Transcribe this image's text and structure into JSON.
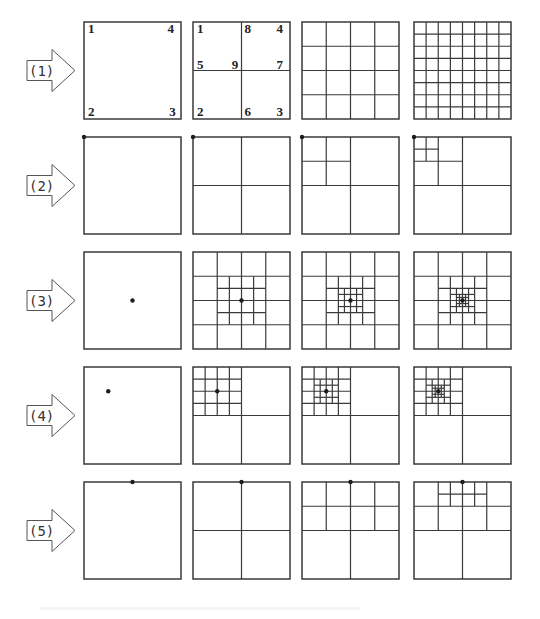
{
  "figure": {
    "stroke_color": "#3a3a3a",
    "dot_color": "#1e1e1e",
    "columns_x": [
      84,
      193,
      302,
      414
    ],
    "box_size": 97,
    "rows": [
      {
        "label": "(1)",
        "y": 22,
        "panels": [
          {
            "lines": [],
            "dot": null,
            "labels": [
              {
                "t": "1",
                "x": 0.04,
                "y": 0.11
              },
              {
                "t": "4",
                "x": 0.86,
                "y": 0.11
              },
              {
                "t": "2",
                "x": 0.04,
                "y": 0.97
              },
              {
                "t": "3",
                "x": 0.88,
                "y": 0.97
              }
            ]
          },
          {
            "lines": [
              [
                0.5,
                0,
                0.5,
                1
              ],
              [
                0,
                0.5,
                1,
                0.5
              ]
            ],
            "dot": null,
            "labels": [
              {
                "t": "1",
                "x": 0.04,
                "y": 0.11
              },
              {
                "t": "8",
                "x": 0.53,
                "y": 0.11
              },
              {
                "t": "4",
                "x": 0.86,
                "y": 0.11
              },
              {
                "t": "5",
                "x": 0.04,
                "y": 0.48
              },
              {
                "t": "9",
                "x": 0.4,
                "y": 0.48
              },
              {
                "t": "7",
                "x": 0.86,
                "y": 0.48
              },
              {
                "t": "2",
                "x": 0.04,
                "y": 0.97
              },
              {
                "t": "6",
                "x": 0.53,
                "y": 0.97
              },
              {
                "t": "3",
                "x": 0.86,
                "y": 0.97
              }
            ]
          },
          {
            "grid": 4,
            "lines": [],
            "dot": null,
            "labels": []
          },
          {
            "grid": 8,
            "lines": [],
            "dot": null,
            "labels": []
          }
        ]
      },
      {
        "label": "(2)",
        "y": 137,
        "panels": [
          {
            "lines": [],
            "dot": [
              0,
              0
            ],
            "labels": []
          },
          {
            "lines": [
              [
                0.5,
                0,
                0.5,
                1
              ],
              [
                0,
                0.5,
                1,
                0.5
              ]
            ],
            "dot": [
              0,
              0
            ],
            "labels": []
          },
          {
            "lines": [
              [
                0.5,
                0,
                0.5,
                1
              ],
              [
                0,
                0.5,
                1,
                0.5
              ],
              [
                0.25,
                0,
                0.25,
                0.5
              ],
              [
                0,
                0.25,
                0.5,
                0.25
              ]
            ],
            "dot": [
              0,
              0
            ],
            "labels": []
          },
          {
            "lines": [
              [
                0.5,
                0,
                0.5,
                1
              ],
              [
                0,
                0.5,
                1,
                0.5
              ],
              [
                0.25,
                0,
                0.25,
                0.5
              ],
              [
                0,
                0.25,
                0.5,
                0.25
              ],
              [
                0.125,
                0,
                0.125,
                0.25
              ],
              [
                0,
                0.125,
                0.25,
                0.125
              ]
            ],
            "dot": [
              0,
              0
            ],
            "labels": []
          }
        ]
      },
      {
        "label": "(3)",
        "y": 252,
        "panels": [
          {
            "lines": [],
            "dot": [
              0.5,
              0.5
            ],
            "labels": []
          },
          {
            "grid": 4,
            "lines": [
              [
                0.375,
                0.25,
                0.375,
                0.75
              ],
              [
                0.625,
                0.25,
                0.625,
                0.75
              ],
              [
                0.25,
                0.375,
                0.75,
                0.375
              ],
              [
                0.25,
                0.625,
                0.75,
                0.625
              ]
            ],
            "dot": [
              0.5,
              0.5
            ],
            "labels": []
          },
          {
            "grid": 4,
            "lines": [
              [
                0.375,
                0.25,
                0.375,
                0.75
              ],
              [
                0.625,
                0.25,
                0.625,
                0.75
              ],
              [
                0.25,
                0.375,
                0.75,
                0.375
              ],
              [
                0.25,
                0.625,
                0.75,
                0.625
              ],
              [
                0.4375,
                0.375,
                0.4375,
                0.625
              ],
              [
                0.5625,
                0.375,
                0.5625,
                0.625
              ],
              [
                0.375,
                0.4375,
                0.625,
                0.4375
              ],
              [
                0.375,
                0.5625,
                0.625,
                0.5625
              ]
            ],
            "dot": [
              0.5,
              0.5
            ],
            "labels": []
          },
          {
            "grid": 4,
            "lines": [
              [
                0.375,
                0.25,
                0.375,
                0.75
              ],
              [
                0.625,
                0.25,
                0.625,
                0.75
              ],
              [
                0.25,
                0.375,
                0.75,
                0.375
              ],
              [
                0.25,
                0.625,
                0.75,
                0.625
              ],
              [
                0.4375,
                0.375,
                0.4375,
                0.625
              ],
              [
                0.5625,
                0.375,
                0.5625,
                0.625
              ],
              [
                0.375,
                0.4375,
                0.625,
                0.4375
              ],
              [
                0.375,
                0.5625,
                0.625,
                0.5625
              ],
              [
                0.46875,
                0.4375,
                0.46875,
                0.5625
              ],
              [
                0.53125,
                0.4375,
                0.53125,
                0.5625
              ],
              [
                0.4375,
                0.46875,
                0.5625,
                0.46875
              ],
              [
                0.4375,
                0.53125,
                0.5625,
                0.53125
              ]
            ],
            "dot": [
              0.5,
              0.5
            ],
            "labels": []
          }
        ]
      },
      {
        "label": "(4)",
        "y": 367,
        "panels": [
          {
            "lines": [],
            "dot": [
              0.25,
              0.25
            ],
            "labels": []
          },
          {
            "lines": [
              [
                0.5,
                0,
                0.5,
                1
              ],
              [
                0,
                0.5,
                1,
                0.5
              ],
              [
                0.125,
                0,
                0.125,
                0.5
              ],
              [
                0.25,
                0,
                0.25,
                0.5
              ],
              [
                0.375,
                0,
                0.375,
                0.5
              ],
              [
                0,
                0.125,
                0.5,
                0.125
              ],
              [
                0,
                0.25,
                0.5,
                0.25
              ],
              [
                0,
                0.375,
                0.5,
                0.375
              ]
            ],
            "dot": [
              0.25,
              0.25
            ],
            "labels": []
          },
          {
            "lines": [
              [
                0.5,
                0,
                0.5,
                1
              ],
              [
                0,
                0.5,
                1,
                0.5
              ],
              [
                0.125,
                0,
                0.125,
                0.5
              ],
              [
                0.25,
                0,
                0.25,
                0.5
              ],
              [
                0.375,
                0,
                0.375,
                0.5
              ],
              [
                0,
                0.125,
                0.5,
                0.125
              ],
              [
                0,
                0.25,
                0.5,
                0.25
              ],
              [
                0,
                0.375,
                0.5,
                0.375
              ],
              [
                0.1875,
                0.125,
                0.1875,
                0.375
              ],
              [
                0.3125,
                0.125,
                0.3125,
                0.375
              ],
              [
                0.125,
                0.1875,
                0.375,
                0.1875
              ],
              [
                0.125,
                0.3125,
                0.375,
                0.3125
              ]
            ],
            "dot": [
              0.25,
              0.25
            ],
            "labels": []
          },
          {
            "lines": [
              [
                0.5,
                0,
                0.5,
                1
              ],
              [
                0,
                0.5,
                1,
                0.5
              ],
              [
                0.125,
                0,
                0.125,
                0.5
              ],
              [
                0.25,
                0,
                0.25,
                0.5
              ],
              [
                0.375,
                0,
                0.375,
                0.5
              ],
              [
                0,
                0.125,
                0.5,
                0.125
              ],
              [
                0,
                0.25,
                0.5,
                0.25
              ],
              [
                0,
                0.375,
                0.5,
                0.375
              ],
              [
                0.1875,
                0.125,
                0.1875,
                0.375
              ],
              [
                0.3125,
                0.125,
                0.3125,
                0.375
              ],
              [
                0.125,
                0.1875,
                0.375,
                0.1875
              ],
              [
                0.125,
                0.3125,
                0.375,
                0.3125
              ],
              [
                0.21875,
                0.1875,
                0.21875,
                0.3125
              ],
              [
                0.28125,
                0.1875,
                0.28125,
                0.3125
              ],
              [
                0.1875,
                0.21875,
                0.3125,
                0.21875
              ],
              [
                0.1875,
                0.28125,
                0.3125,
                0.28125
              ]
            ],
            "dot": [
              0.25,
              0.25
            ],
            "labels": []
          }
        ]
      },
      {
        "label": "(5)",
        "y": 482,
        "panels": [
          {
            "lines": [],
            "dot": [
              0.5,
              0
            ],
            "labels": []
          },
          {
            "lines": [
              [
                0.5,
                0,
                0.5,
                1
              ],
              [
                0,
                0.5,
                1,
                0.5
              ]
            ],
            "dot": [
              0.5,
              0
            ],
            "labels": []
          },
          {
            "lines": [
              [
                0.5,
                0,
                0.5,
                1
              ],
              [
                0,
                0.5,
                1,
                0.5
              ],
              [
                0.25,
                0,
                0.25,
                0.5
              ],
              [
                0.75,
                0,
                0.75,
                0.5
              ],
              [
                0,
                0.25,
                1,
                0.25
              ]
            ],
            "dot": [
              0.5,
              0
            ],
            "labels": []
          },
          {
            "lines": [
              [
                0.5,
                0,
                0.5,
                1
              ],
              [
                0,
                0.5,
                1,
                0.5
              ],
              [
                0.25,
                0,
                0.25,
                0.5
              ],
              [
                0.75,
                0,
                0.75,
                0.5
              ],
              [
                0,
                0.25,
                1,
                0.25
              ],
              [
                0.375,
                0,
                0.375,
                0.25
              ],
              [
                0.625,
                0,
                0.625,
                0.25
              ],
              [
                0.25,
                0.125,
                0.75,
                0.125
              ]
            ],
            "dot": [
              0.5,
              0
            ],
            "labels": []
          }
        ]
      }
    ]
  }
}
